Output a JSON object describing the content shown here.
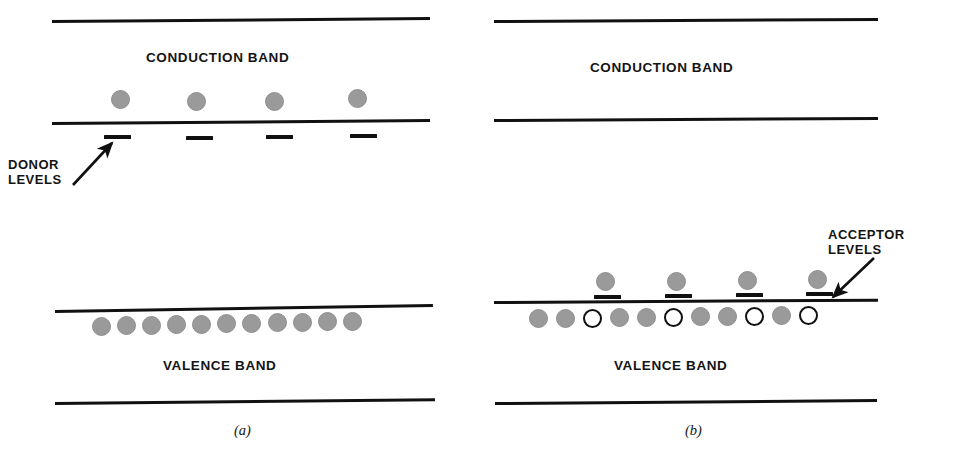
{
  "figure": {
    "width": 972,
    "height": 459,
    "background": "#ffffff",
    "ink_color": "#111111",
    "electron_fill": "#9a9a9a",
    "hole_fill": "#ffffff",
    "hole_stroke": "#101010"
  },
  "panel_a": {
    "caption": "(a)",
    "conduction_band_label": "CONDUCTION BAND",
    "valence_band_label": "VALENCE BAND",
    "annotation_line1": "DONOR",
    "annotation_line2": "LEVELS",
    "conduction_electron_count": 4,
    "donor_level_count": 4,
    "valence_electron_count": 11,
    "valence_hole_count": 0,
    "conduction_electrons_x": [
      120,
      196,
      274,
      357
    ],
    "donor_levels_x": [
      104,
      186,
      266,
      350
    ],
    "valence_electrons_x": [
      101,
      126,
      151,
      176,
      201,
      226,
      251,
      277,
      302,
      327,
      352
    ]
  },
  "panel_b": {
    "caption": "(b)",
    "conduction_band_label": "CONDUCTION BAND",
    "valence_band_label": "VALENCE BAND",
    "annotation_line1": "ACCEPTOR",
    "annotation_line2": "LEVELS",
    "conduction_electron_count": 0,
    "acceptor_level_count": 4,
    "acceptor_electron_count": 4,
    "valence_electron_count": 7,
    "valence_hole_count": 4,
    "acceptor_levels_x": [
      108,
      179,
      250,
      320
    ],
    "acceptor_electrons_x": [
      110,
      181,
      252,
      322
    ],
    "valence_circles": [
      {
        "x": 52,
        "type": "electron"
      },
      {
        "x": 79,
        "type": "electron"
      },
      {
        "x": 106,
        "type": "hole"
      },
      {
        "x": 133,
        "type": "electron"
      },
      {
        "x": 160,
        "type": "electron"
      },
      {
        "x": 187,
        "type": "hole"
      },
      {
        "x": 214,
        "type": "electron"
      },
      {
        "x": 241,
        "type": "electron"
      },
      {
        "x": 268,
        "type": "hole"
      },
      {
        "x": 295,
        "type": "electron"
      },
      {
        "x": 322,
        "type": "hole"
      }
    ]
  }
}
